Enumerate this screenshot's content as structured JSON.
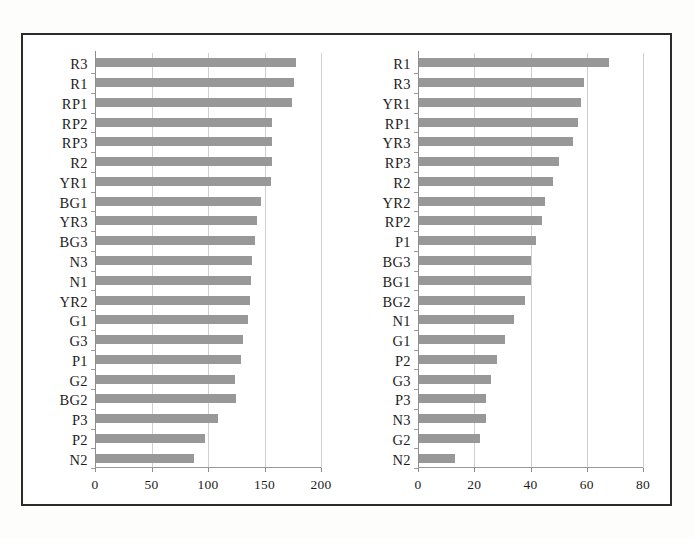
{
  "figure": {
    "panels": [
      {
        "id": "left",
        "name": "left-bar-chart"
      },
      {
        "id": "right",
        "name": "right-bar-chart"
      }
    ]
  },
  "chart_data": [
    {
      "type": "bar",
      "orientation": "horizontal",
      "title": "",
      "xlabel": "",
      "ylabel": "",
      "xlim": [
        0,
        200
      ],
      "xticks": [
        0,
        50,
        100,
        150,
        200
      ],
      "xtick_labels": [
        "0",
        "50",
        "100",
        "150",
        "200"
      ],
      "grid": true,
      "grid_axis": "x",
      "legend": false,
      "bar_color": "#989898",
      "categories": [
        "R3",
        "R1",
        "RP1",
        "RP2",
        "RP3",
        "R2",
        "YR1",
        "BG1",
        "YR3",
        "BG3",
        "N3",
        "N1",
        "YR2",
        "G1",
        "G3",
        "P1",
        "G2",
        "BG2",
        "P3",
        "P2",
        "N2"
      ],
      "values": [
        178,
        176,
        174,
        157,
        157,
        157,
        156,
        147,
        143,
        142,
        139,
        138,
        137,
        135,
        131,
        129,
        124,
        125,
        109,
        97,
        88
      ]
    },
    {
      "type": "bar",
      "orientation": "horizontal",
      "title": "",
      "xlabel": "",
      "ylabel": "",
      "xlim": [
        0,
        80
      ],
      "xticks": [
        0,
        20,
        40,
        60,
        80
      ],
      "xtick_labels": [
        "0",
        "20",
        "40",
        "60",
        "80"
      ],
      "grid": true,
      "grid_axis": "x",
      "legend": false,
      "bar_color": "#989898",
      "categories": [
        "R1",
        "R3",
        "YR1",
        "RP1",
        "YR3",
        "RP3",
        "R2",
        "YR2",
        "RP2",
        "P1",
        "BG3",
        "BG1",
        "BG2",
        "N1",
        "G1",
        "P2",
        "G3",
        "P3",
        "N3",
        "G2",
        "N2"
      ],
      "values": [
        68,
        59,
        58,
        57,
        55,
        50,
        48,
        45,
        44,
        42,
        40,
        40,
        38,
        34,
        31,
        28,
        26,
        24,
        24,
        22,
        13
      ]
    }
  ]
}
